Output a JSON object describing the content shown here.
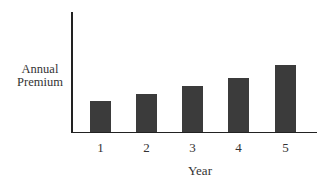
{
  "chart_data": {
    "type": "bar",
    "title": "",
    "xlabel": "Year",
    "ylabel": "Annual Premium",
    "ylabel_lines": [
      "Annual",
      "Premium"
    ],
    "categories": [
      "1",
      "2",
      "3",
      "4",
      "5"
    ],
    "values": [
      31,
      38,
      46,
      54,
      67
    ],
    "values_note": "relative bar heights (no y-axis scale shown)",
    "ylim": [
      0,
      120
    ],
    "grid": false,
    "legend": null,
    "bar_color": "#3b3b3b"
  }
}
